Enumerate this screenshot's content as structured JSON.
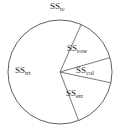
{
  "chart_data": {
    "type": "pie",
    "title": "",
    "subtitle": "",
    "xlabel": "",
    "ylabel": "",
    "grid": false,
    "legend_position": "none",
    "outside_label": "SStc",
    "outside_label_base": "SS",
    "outside_label_sub": "tc",
    "categories": [
      "SStrt",
      "SSrow",
      "SScol",
      "SSerr"
    ],
    "values": [
      62.5,
      13.9,
      7.8,
      15.8
    ],
    "units": "percent of total",
    "total_degrees": 360,
    "slices": [
      {
        "name": "SStrt",
        "base": "SS",
        "subscript": "trt",
        "value": 62.5,
        "degrees": 225,
        "start_angle_deg": 69,
        "end_angle_deg": 294,
        "fill": "#ffffff",
        "stroke": "#4d4d4d",
        "label_placement": "inside"
      },
      {
        "name": "SSrow",
        "base": "SS",
        "subscript": "row",
        "value": 13.9,
        "degrees": 50,
        "start_angle_deg": -66,
        "end_angle_deg": -16,
        "fill": "#ffffff",
        "stroke": "#4d4d4d",
        "label_placement": "inside"
      },
      {
        "name": "SScol",
        "base": "SS",
        "subscript": "col",
        "value": 7.8,
        "degrees": 28,
        "start_angle_deg": -16,
        "end_angle_deg": 12,
        "fill": "#ffffff",
        "stroke": "#4d4d4d",
        "label_placement": "inside"
      },
      {
        "name": "SSerr",
        "base": "SS",
        "subscript": "err",
        "value": 15.8,
        "degrees": 57,
        "start_angle_deg": 12,
        "end_angle_deg": 69,
        "fill": "#ffffff",
        "stroke": "#4d4d4d",
        "label_placement": "inside"
      }
    ],
    "colors": {
      "slice_fill": "#ffffff",
      "outline": "#4d4d4d",
      "divider": "#555555",
      "text": "#1a1a1a",
      "background": "#ffffff"
    },
    "geometry": {
      "center_x": 60,
      "center_y": 72,
      "radius": 52
    }
  },
  "labels": {
    "tc": {
      "base": "SS",
      "sub": "tc"
    },
    "trt": {
      "base": "SS",
      "sub": "trt"
    },
    "row": {
      "base": "SS",
      "sub": "row"
    },
    "col": {
      "base": "SS",
      "sub": "col"
    },
    "err": {
      "base": "SS",
      "sub": "err"
    }
  }
}
